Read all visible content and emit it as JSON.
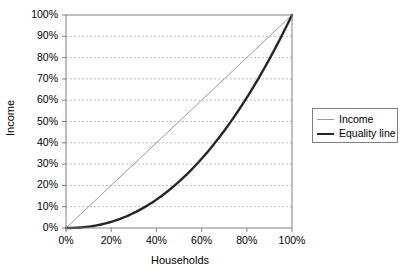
{
  "chart_data": {
    "type": "line",
    "title": "",
    "xlabel": "Households",
    "ylabel": "Income",
    "xlim": [
      0,
      100
    ],
    "ylim": [
      0,
      100
    ],
    "grid": "horizontal-dashed",
    "legend_position": "right",
    "x_ticks": [
      "0%",
      "20%",
      "40%",
      "60%",
      "80%",
      "100%"
    ],
    "x_tick_values": [
      0,
      20,
      40,
      60,
      80,
      100
    ],
    "y_ticks": [
      "0%",
      "10%",
      "20%",
      "30%",
      "40%",
      "50%",
      "60%",
      "70%",
      "80%",
      "90%",
      "100%"
    ],
    "y_tick_values": [
      0,
      10,
      20,
      30,
      40,
      50,
      60,
      70,
      80,
      90,
      100
    ],
    "x": [
      0,
      5,
      10,
      15,
      20,
      25,
      30,
      35,
      40,
      45,
      50,
      55,
      60,
      65,
      70,
      75,
      80,
      85,
      90,
      95,
      100
    ],
    "series": [
      {
        "name": "Income",
        "style": "thin-gray",
        "color": "#9a9a9a",
        "width": 1,
        "values": [
          0,
          5,
          10,
          15,
          20,
          25,
          30,
          35,
          40,
          45,
          50,
          55,
          60,
          65,
          70,
          75,
          80,
          85,
          90,
          95,
          100
        ]
      },
      {
        "name": "Equality line",
        "style": "thick-black",
        "color": "#262626",
        "width": 2.4,
        "values": [
          0,
          0.9,
          2.5,
          4.6,
          7.0,
          9.8,
          12.9,
          16.3,
          20.0,
          24.0,
          22.0,
          32.6,
          37.2,
          42.0,
          47.0,
          52.2,
          57.7,
          63.3,
          69.1,
          75.1,
          100
        ]
      }
    ]
  },
  "legend": {
    "items": [
      {
        "label": "Income"
      },
      {
        "label": "Equality line"
      }
    ]
  },
  "axes": {
    "x_title": "Households",
    "y_title": "Income"
  },
  "colors": {
    "plot_border": "#808080",
    "gridline": "#bfbfbf",
    "income_line": "#9a9a9a",
    "equality_line": "#262626",
    "text": "#000000",
    "background": "#ffffff"
  }
}
